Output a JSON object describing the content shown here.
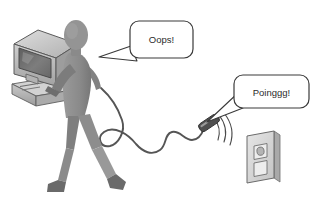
{
  "illustration": {
    "title": "Person carrying computer unplugs cord from wall outlet",
    "background_color": "#ffffff",
    "line_color": "#3a3a3a",
    "figure_color": "#8d8d8d",
    "figure_shadow_color": "#6f6f6f",
    "monitor_color": "#b9b9b9",
    "screen_color": "#6e6e6e",
    "outlet_color": "#d8d8d8",
    "plug_color": "#4a4a4a",
    "cord_color": "#555555"
  },
  "speech_bubbles": [
    {
      "id": "oops",
      "text": "Oops!",
      "speaker": "person",
      "tail_direction": "left"
    },
    {
      "id": "poinggg",
      "text": "Poinggg!",
      "speaker": "plug",
      "tail_direction": "down-left"
    }
  ],
  "objects": {
    "person_label": "walking-person",
    "monitor_label": "crt-monitor",
    "computer_base_label": "computer-base-unit",
    "cord_label": "power-cord",
    "plug_label": "power-plug",
    "outlet_label": "wall-outlet",
    "motion_lines_label": "motion-lines"
  }
}
